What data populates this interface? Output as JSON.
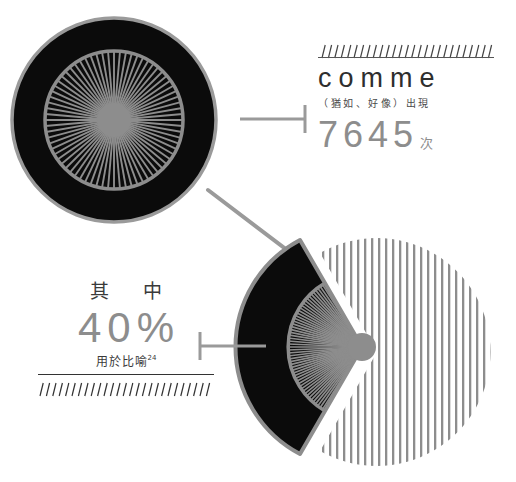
{
  "canvas": {
    "width": 516,
    "height": 482,
    "background": "#ffffff"
  },
  "palette": {
    "black": "#0b0b0b",
    "gray": "#8d8d8d",
    "gray_rule": "#555555",
    "dark_text": "#2e2e2e",
    "stripe": "#8d8d8d",
    "connector": "#9a9a9a"
  },
  "callout_comme": {
    "word": "comme",
    "gloss": "（猶如、好像）出現",
    "count": "7645",
    "count_unit": "次",
    "hatch_count": 27,
    "hatch_direction": "up"
  },
  "callout_percent": {
    "prefix": "其 中",
    "value": "40%",
    "note": "用於比喻",
    "note_superscript": "24",
    "hatch_count": 27,
    "hatch_direction": "down"
  },
  "chart_data": {
    "type": "pie",
    "categories": [
      "用於比喻",
      "其他用法"
    ],
    "values": [
      40,
      60
    ],
    "unit": "%",
    "labels": [
      "40%",
      "60%"
    ],
    "total_occurrences": 7645,
    "total_occurrences_label": "7645 次",
    "styles": [
      {
        "name": "用於比喻",
        "fill": "#0b0b0b",
        "stroke": "#8d8d8d",
        "exploded": true,
        "inner_sunburst": true
      },
      {
        "name": "其他用法",
        "fill": "vertical-stripes",
        "stroke": "none",
        "exploded": false
      }
    ],
    "legend": "none",
    "grid": false,
    "annotations": [
      {
        "text": "comme",
        "target": "whole"
      },
      {
        "text": "（猶如、好像）出現",
        "target": "whole"
      },
      {
        "text": "7645次",
        "target": "whole"
      },
      {
        "text": "其 中",
        "target": "slice-0"
      },
      {
        "text": "40%",
        "target": "slice-0"
      },
      {
        "text": "用於比喻24",
        "target": "slice-0"
      }
    ]
  },
  "figures": {
    "donut_total": {
      "name": "total-occurrences-disc",
      "description": "black disc with gray outer ring and radial sunburst core",
      "spokes": 72,
      "center_x": 114,
      "center_y": 120,
      "radius": 103
    },
    "pie_split": {
      "name": "proportion-pie",
      "center_x": 377,
      "center_y": 352,
      "radius": 114,
      "slice_start_deg": 120,
      "slice_sweep_deg": 144,
      "spokes": 52
    }
  },
  "connectors": [
    {
      "name": "comme-leader",
      "orientation": "horizontal",
      "tick_side": "right"
    },
    {
      "name": "percent-leader",
      "orientation": "horizontal",
      "tick_side": "left"
    },
    {
      "name": "disc-to-pie-leader",
      "orientation": "diagonal",
      "tick_side": "none"
    }
  ]
}
